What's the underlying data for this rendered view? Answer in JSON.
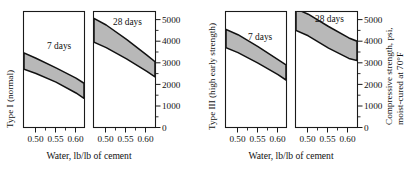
{
  "figure": {
    "x_axis_title": "Water, lb/lb of cement",
    "right_axis_title_line1": "Compressive strength, psi,",
    "right_axis_title_line2": "moist-cured at 70°F",
    "group_left_label": "Type I (normal)",
    "group_right_label": "Type III (high early strength)",
    "annotation_7days": "7 days",
    "annotation_28days": "28 days",
    "x_tick_labels": [
      "0.50",
      "0.55",
      "0.60"
    ],
    "y_tick_labels": [
      "0",
      "1000",
      "2000",
      "3000",
      "4000",
      "5000"
    ],
    "band_fill_color": "#b8b8b8",
    "line_color": "#111111",
    "background_color": "#ffffff"
  },
  "chart_data": {
    "type": "area",
    "title": "",
    "subtitle": "",
    "xlabel": "Water, lb/lb of cement",
    "ylabel": "Compressive strength, psi, moist-cured at 70°F",
    "xlim": [
      0.47,
      0.62
    ],
    "ylim": [
      0,
      5000
    ],
    "xticks": [
      0.5,
      0.55,
      0.6
    ],
    "xticklabels": [
      "0.50",
      "0.55",
      "0.60"
    ],
    "yticks": [
      0,
      1000,
      2000,
      3000,
      4000,
      5000
    ],
    "yticklabels": [
      "0",
      "1000",
      "2000",
      "3000",
      "4000",
      "5000"
    ],
    "yticks_minor": [
      500,
      1500,
      2500,
      3500,
      4500
    ],
    "grid": false,
    "legend": "none",
    "panels": [
      {
        "panel_index": 0,
        "group": "Type I (normal)",
        "annotation": "7 days",
        "x": [
          0.47,
          0.5,
          0.55,
          0.6,
          0.62
        ],
        "upper": [
          3450,
          3210,
          2760,
          2290,
          2050
        ],
        "lower": [
          2700,
          2500,
          2100,
          1600,
          1350
        ]
      },
      {
        "panel_index": 1,
        "group": "Type I (normal)",
        "annotation": "28 days",
        "x": [
          0.47,
          0.5,
          0.55,
          0.6,
          0.62
        ],
        "upper": [
          5050,
          4750,
          4080,
          3350,
          3050
        ],
        "lower": [
          3950,
          3700,
          3180,
          2600,
          2350
        ]
      },
      {
        "panel_index": 2,
        "group": "Type III (high early strength)",
        "annotation": "7 days",
        "x": [
          0.47,
          0.5,
          0.55,
          0.6,
          0.62
        ],
        "upper": [
          4550,
          4300,
          3750,
          3150,
          2900
        ],
        "lower": [
          3700,
          3470,
          2980,
          2450,
          2200
        ]
      },
      {
        "panel_index": 3,
        "group": "Type III (high early strength)",
        "annotation": "28 days",
        "x": [
          0.47,
          0.5,
          0.55,
          0.6,
          0.62
        ],
        "upper": [
          5500,
          5250,
          4680,
          4150,
          4000
        ],
        "lower": [
          4500,
          4250,
          3680,
          3200,
          3100
        ]
      }
    ]
  }
}
